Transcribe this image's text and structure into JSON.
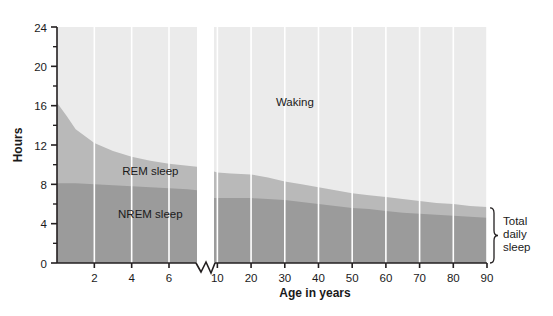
{
  "chart_data": {
    "type": "area",
    "title": "",
    "subtitle": "",
    "xlabel": "Age in years",
    "ylabel": "Hours",
    "grid": true,
    "legend": "in-plot-annotations",
    "xlim": [
      0,
      90
    ],
    "ylim": [
      0,
      24
    ],
    "x_axis_break": {
      "present": true,
      "between": [
        7.5,
        9.0
      ],
      "note": "scale changes from linear-per-year (birth-7) to compressed decades (10-90)"
    },
    "y_ticks_major": [
      0,
      4,
      8,
      12,
      16,
      20,
      24
    ],
    "y_ticks_minor": [
      2,
      6,
      10,
      14,
      18,
      22
    ],
    "x_ticks": [
      2,
      4,
      6,
      10,
      20,
      30,
      40,
      50,
      60,
      70,
      80,
      90
    ],
    "x_tick_labels": [
      "2",
      "4",
      "6",
      "10",
      "20",
      "30",
      "40",
      "50",
      "60",
      "70",
      "80",
      "90"
    ],
    "y_tick_labels": [
      "0",
      "4",
      "8",
      "12",
      "16",
      "20",
      "24"
    ],
    "annotations": [
      {
        "name": "waking-label",
        "text": "Waking",
        "x": 33,
        "y": 16.0
      },
      {
        "name": "rem-label",
        "text": "REM sleep",
        "x": 5.0,
        "y": 8.9
      },
      {
        "name": "nrem-label",
        "text": "NREM sleep",
        "x": 5.0,
        "y": 4.6
      },
      {
        "name": "total-sleep-label",
        "text": "Total daily sleep",
        "x": 93,
        "y": 2.8
      }
    ],
    "bracket": {
      "name": "total-daily-sleep-bracket",
      "from_y": 0,
      "to_y": 5.6,
      "at_x": 91
    },
    "series": [
      {
        "name": "NREM sleep",
        "color": "#9b9b9b",
        "x": [
          0.0,
          0.5,
          1.0,
          2.0,
          3.0,
          4.0,
          5.0,
          6.0,
          7.0,
          7.5,
          9.0,
          10.0,
          14.0,
          20.0,
          25.0,
          30.0,
          35.0,
          40.0,
          45.0,
          50.0,
          55.0,
          60.0,
          65.0,
          70.0,
          75.0,
          80.0,
          85.0,
          90.0
        ],
        "values": [
          8.1,
          8.1,
          8.1,
          8.0,
          7.9,
          7.8,
          7.7,
          7.6,
          7.5,
          7.4,
          6.6,
          6.6,
          6.6,
          6.6,
          6.5,
          6.4,
          6.2,
          6.0,
          5.8,
          5.6,
          5.5,
          5.3,
          5.1,
          5.0,
          4.9,
          4.8,
          4.7,
          4.6
        ]
      },
      {
        "name": "REM sleep",
        "color": "#b9b9b9",
        "note": "values are the TOTAL daily sleep upper boundary (REM band = total minus NREM)",
        "x": [
          0.0,
          0.5,
          1.0,
          2.0,
          3.0,
          4.0,
          5.0,
          6.0,
          7.0,
          7.5,
          9.0,
          10.0,
          14.0,
          20.0,
          25.0,
          30.0,
          35.0,
          40.0,
          45.0,
          50.0,
          55.0,
          60.0,
          65.0,
          70.0,
          75.0,
          80.0,
          85.0,
          90.0
        ],
        "values": [
          16.3,
          15.0,
          13.6,
          12.2,
          11.4,
          10.8,
          10.4,
          10.1,
          9.9,
          9.8,
          9.3,
          9.2,
          9.1,
          9.0,
          8.7,
          8.3,
          8.0,
          7.7,
          7.4,
          7.1,
          6.9,
          6.7,
          6.5,
          6.3,
          6.1,
          6.0,
          5.8,
          5.7
        ]
      },
      {
        "name": "Waking",
        "color": "#ebebeb",
        "note": "fills the remainder of the 24-hour day above total sleep",
        "x": [
          0,
          90
        ],
        "values": [
          24,
          24
        ]
      }
    ]
  },
  "colors": {
    "waking": "#ebebeb",
    "rem": "#b9b9b9",
    "nrem": "#9b9b9b",
    "gridline": "#ffffff",
    "axis": "#231f20",
    "text": "#1a1a1a",
    "page": "#ffffff"
  }
}
